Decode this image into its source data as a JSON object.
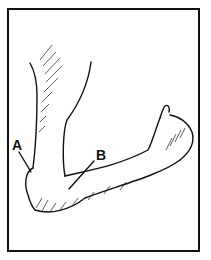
{
  "figure": {
    "labels": [
      {
        "id": "A",
        "text": "A",
        "target": "outer point of elbow"
      },
      {
        "id": "B",
        "text": "B",
        "target": "inner elbow crease area"
      }
    ],
    "colors": {
      "line": "#111111",
      "background": "#ffffff",
      "border": "#111111"
    }
  }
}
